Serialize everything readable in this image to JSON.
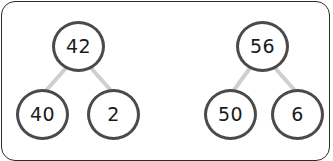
{
  "card": {
    "background_color": "#ffffff",
    "border_color": "#2b2b2b"
  },
  "style": {
    "node_stroke_color": "#4a4a4a",
    "link_color": "#cfcfcf",
    "text_color": "#1a1a1a"
  },
  "diagrams": [
    {
      "name": "number-bond-42",
      "whole": "42",
      "parts": [
        "40",
        "2"
      ]
    },
    {
      "name": "number-bond-56",
      "whole": "56",
      "parts": [
        "50",
        "6"
      ]
    }
  ]
}
